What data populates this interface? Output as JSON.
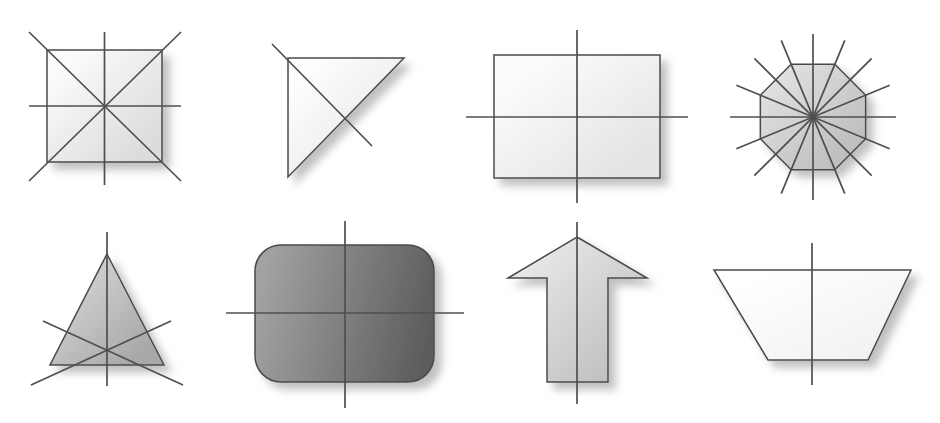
{
  "figure": {
    "background_color": "#ffffff",
    "width": 940,
    "height": 423,
    "outline_color": "#4a4a4a",
    "symmetry_line_color": "#4f4f4f",
    "shadow_color": "#b4b4b4",
    "rows": 2,
    "columns": 4
  },
  "shapes": [
    {
      "id": "square",
      "name": "square",
      "row": 1,
      "column": 1,
      "lines_of_symmetry": 4,
      "fill_start": "#fbfbfb",
      "fill_end": "#dcdcdc",
      "gradient_angle_deg": 135,
      "geometry": {
        "type": "polygon",
        "points": "47,50 162,50 162,162 47,162"
      },
      "symmetry_lines": [
        {
          "label": "vertical",
          "x1": 104.5,
          "y1": 32,
          "x2": 104.5,
          "y2": 185
        },
        {
          "label": "horizontal",
          "x1": 29,
          "y1": 106,
          "x2": 181,
          "y2": 106
        },
        {
          "label": "diagonal-down-right",
          "x1": 29,
          "y1": 32,
          "x2": 181,
          "y2": 181
        },
        {
          "label": "diagonal-up-right",
          "x1": 29,
          "y1": 181,
          "x2": 181,
          "y2": 32
        }
      ]
    },
    {
      "id": "right-triangle",
      "name": "right triangle",
      "row": 1,
      "column": 2,
      "lines_of_symmetry": 1,
      "fill_start": "#fdfdfd",
      "fill_end": "#e6e6e6",
      "gradient_angle_deg": 135,
      "geometry": {
        "type": "polygon",
        "points": "288,58 404,58 288,177"
      },
      "symmetry_lines": [
        {
          "label": "diagonal",
          "x1": 272,
          "y1": 44,
          "x2": 372,
          "y2": 146
        }
      ]
    },
    {
      "id": "rectangle",
      "name": "rectangle",
      "row": 1,
      "column": 3,
      "lines_of_symmetry": 2,
      "fill_start": "#fcfcfc",
      "fill_end": "#e4e4e4",
      "gradient_angle_deg": 135,
      "geometry": {
        "type": "polygon",
        "points": "494,55 660,55 660,178 494,178"
      },
      "symmetry_lines": [
        {
          "label": "vertical",
          "x1": 577,
          "y1": 30,
          "x2": 577,
          "y2": 203
        },
        {
          "label": "horizontal",
          "x1": 466,
          "y1": 117,
          "x2": 688,
          "y2": 117
        }
      ]
    },
    {
      "id": "octagon",
      "name": "regular octagon",
      "row": 1,
      "column": 4,
      "lines_of_symmetry": 8,
      "fill_start": "#e0e0e0",
      "fill_end": "#bdbdbd",
      "gradient_angle_deg": 135,
      "geometry": {
        "type": "regular-polygon",
        "cx": 813,
        "cy": 117,
        "r": 57,
        "sides": 8,
        "rotation_deg": 22.5
      },
      "symmetry_lines_extent": 83
    },
    {
      "id": "equilateral-triangle",
      "name": "equilateral triangle",
      "row": 2,
      "column": 1,
      "lines_of_symmetry": 3,
      "fill_start": "#d6d6d6",
      "fill_end": "#a8a8a8",
      "gradient_angle_deg": 135,
      "geometry": {
        "type": "polygon",
        "points": "107,254 164,365 50,365"
      },
      "symmetry_lines": [
        {
          "label": "vertical",
          "x1": 107,
          "y1": 232,
          "x2": 107,
          "y2": 386
        },
        {
          "label": "from-left-vertex",
          "x1": 43,
          "y1": 321,
          "x2": 183,
          "y2": 385
        },
        {
          "label": "from-right-vertex",
          "x1": 171,
          "y1": 321,
          "x2": 31,
          "y2": 385
        }
      ]
    },
    {
      "id": "rounded-rectangle",
      "name": "rounded rectangle",
      "row": 2,
      "column": 2,
      "lines_of_symmetry": 2,
      "fill_start": "#a2a2a2",
      "fill_end": "#5c5c5c",
      "gradient_angle_deg": 100,
      "geometry": {
        "type": "rounded-rect",
        "x": 255,
        "y": 245,
        "width": 179,
        "height": 137,
        "rx": 26
      },
      "symmetry_lines": [
        {
          "label": "vertical",
          "x1": 345,
          "y1": 221,
          "x2": 345,
          "y2": 408
        },
        {
          "label": "horizontal",
          "x1": 226,
          "y1": 313,
          "x2": 464,
          "y2": 313
        }
      ]
    },
    {
      "id": "up-arrow",
      "name": "arrow",
      "row": 2,
      "column": 3,
      "lines_of_symmetry": 1,
      "fill_start": "#e8e8e8",
      "fill_end": "#c0c0c0",
      "gradient_angle_deg": 135,
      "geometry": {
        "type": "polygon",
        "points": "577,237 647,278 608,278 608,382 547,382 547,278 508,278"
      },
      "symmetry_lines": [
        {
          "label": "vertical",
          "x1": 577,
          "y1": 222,
          "x2": 577,
          "y2": 404
        }
      ]
    },
    {
      "id": "trapezoid",
      "name": "isosceles trapezoid",
      "row": 2,
      "column": 4,
      "lines_of_symmetry": 1,
      "fill_start": "#ffffff",
      "fill_end": "#f2f2f2",
      "gradient_angle_deg": 135,
      "geometry": {
        "type": "polygon",
        "points": "714,270 911,270 868,360 768,360"
      },
      "symmetry_lines": [
        {
          "label": "vertical",
          "x1": 812,
          "y1": 243,
          "x2": 812,
          "y2": 385
        }
      ]
    }
  ]
}
